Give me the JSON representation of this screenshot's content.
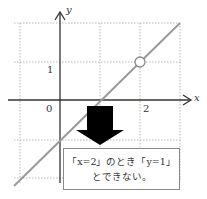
{
  "axes": {
    "x_label": "x",
    "y_label": "y",
    "origin_label": "0",
    "x_tick_label": "2",
    "y_tick_label": "1"
  },
  "graph": {
    "line_equation": "y = x - 1",
    "open_point": {
      "x": 2,
      "y": 1
    },
    "line_color": "#9a9a9a",
    "grid_color": "#b8b8b8"
  },
  "callout": {
    "line1": "「x=2」のとき「y=1」",
    "line2": "とできない。"
  }
}
